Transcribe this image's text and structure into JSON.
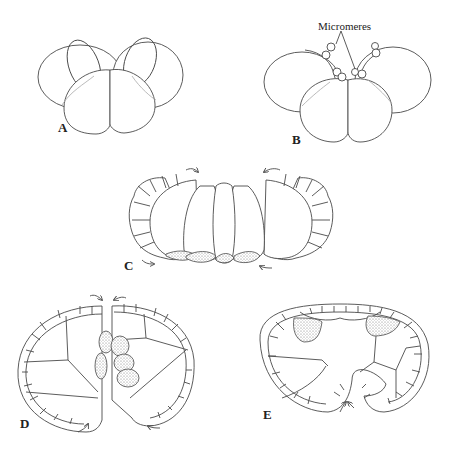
{
  "figure": {
    "panels": [
      {
        "id": "A",
        "label": "A",
        "description": "four-cell stage"
      },
      {
        "id": "B",
        "label": "B",
        "description": "eight-cell stage with micromeres"
      },
      {
        "id": "C",
        "label": "C",
        "description": "cleavage with arrows, stippled vegetal cells"
      },
      {
        "id": "D",
        "label": "D",
        "description": "section with stippled cells at center"
      },
      {
        "id": "E",
        "label": "E",
        "description": "section with invaginating blastopore"
      }
    ],
    "annotation": {
      "text": "Micromeres"
    },
    "colors": {
      "line": "#4a4a4a",
      "faint": "#a8a8a8",
      "background": "#ffffff"
    }
  }
}
